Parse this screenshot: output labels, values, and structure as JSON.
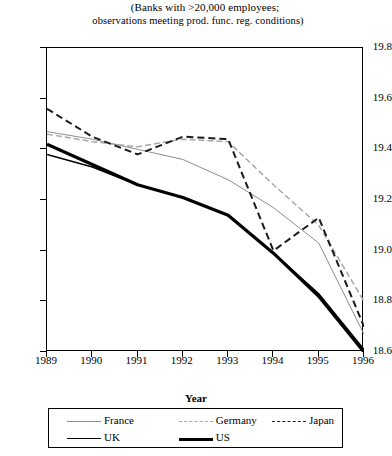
{
  "chart_data": {
    "type": "line",
    "title": "(Banks with >20,000 employees; observations meeting prod. func. reg. conditions)",
    "title_lines": [
      "(Banks with >20,000 employees;",
      "observations meeting prod. func. reg. conditions)"
    ],
    "xlabel": "Year",
    "ylabel": "",
    "categories": [
      1989,
      1990,
      1991,
      1992,
      1993,
      1994,
      1995,
      1996
    ],
    "xtick_labels": [
      "1989",
      "1990",
      "1991",
      "1992",
      "1993",
      "1994",
      "1995",
      "1996"
    ],
    "ytick_labels": [
      "19.8",
      "19.6",
      "19.4",
      "19.2",
      "19.0",
      "18.8",
      "18.6"
    ],
    "ytick_values": [
      19.8,
      19.6,
      19.4,
      19.2,
      19.0,
      18.8,
      18.6
    ],
    "xlim": [
      1989,
      1996
    ],
    "ylim": [
      18.6,
      19.8
    ],
    "grid": false,
    "legend_position": "bottom",
    "series": [
      {
        "name": "France",
        "style": "solid-thin-gray",
        "color": "#8c8c8c",
        "values": [
          19.47,
          19.44,
          19.4,
          19.36,
          19.28,
          19.17,
          19.03,
          18.67
        ]
      },
      {
        "name": "Germany",
        "style": "dashed-light",
        "color": "#a8a8a8",
        "values": [
          19.46,
          19.43,
          19.41,
          19.44,
          19.43,
          19.26,
          19.1,
          18.8
        ]
      },
      {
        "name": "Japan",
        "style": "dashed-dark",
        "color": "#1a1a1a",
        "values": [
          19.56,
          19.45,
          19.38,
          19.45,
          19.44,
          19.0,
          19.13,
          18.7
        ]
      },
      {
        "name": "UK",
        "style": "solid-medium",
        "color": "#000000",
        "values": [
          19.38,
          19.33,
          19.26,
          19.21,
          19.14,
          18.99,
          18.83,
          18.61
        ]
      },
      {
        "name": "US",
        "style": "solid-thick",
        "color": "#000000",
        "values": [
          19.42,
          19.34,
          19.26,
          19.21,
          19.14,
          18.99,
          18.82,
          18.6
        ]
      }
    ],
    "legend": [
      {
        "label": "France",
        "swatch": "sw-france"
      },
      {
        "label": "Germany",
        "swatch": "sw-germany"
      },
      {
        "label": "Japan",
        "swatch": "sw-japan"
      },
      {
        "label": "UK",
        "swatch": "sw-uk"
      },
      {
        "label": "US",
        "swatch": "sw-us"
      }
    ]
  }
}
